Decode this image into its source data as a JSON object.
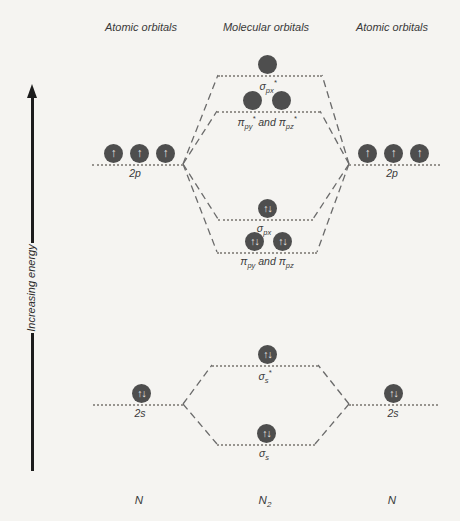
{
  "headers": {
    "left": "Atomic orbitals",
    "center": "Molecular orbitals",
    "right": "Atomic orbitals"
  },
  "energy_axis": {
    "label": "Increasing energy"
  },
  "glyphs": {
    "up": "↑",
    "paired": "↑↓"
  },
  "labels": {
    "sigma_px_star": {
      "sym": "σ",
      "sub": "px",
      "sup": "*"
    },
    "pi_p_star": {
      "sym1": "π",
      "sub1": "py",
      "sup1": "*",
      "conj": " and ",
      "sym2": "π",
      "sub2": "pz",
      "sup2": "*"
    },
    "p2_left": "2p",
    "p2_right": "2p",
    "sigma_px": {
      "sym": "σ",
      "sub": "px"
    },
    "pi_p": {
      "sym1": "π",
      "sub1": "py",
      "conj": " and ",
      "sym2": "π",
      "sub2": "pz"
    },
    "sigma_s_star": {
      "sym": "σ",
      "sub": "s",
      "sup": "*"
    },
    "s2_left": "2s",
    "s2_right": "2s",
    "sigma_s": {
      "sym": "σ",
      "sub": "s"
    }
  },
  "footer": {
    "left": "N",
    "center_base": "N",
    "center_sub": "2",
    "right": "N"
  },
  "structure": {
    "molecule": "N2",
    "molecular_levels": [
      {
        "label": "sigma_px_star",
        "circles": 1,
        "electrons": 0
      },
      {
        "label": "pi_py_star_and_pi_pz_star",
        "circles": 2,
        "electrons": 0
      },
      {
        "label": "sigma_px",
        "circles": 1,
        "electrons": 2
      },
      {
        "label": "pi_py_and_pi_pz",
        "circles": 2,
        "electrons": 4
      },
      {
        "label": "sigma_s_star",
        "circles": 1,
        "electrons": 2
      },
      {
        "label": "sigma_s",
        "circles": 1,
        "electrons": 2
      }
    ],
    "atomic_levels": [
      {
        "label": "2p",
        "side": "left",
        "electrons": 3
      },
      {
        "label": "2p",
        "side": "right",
        "electrons": 3
      },
      {
        "label": "2s",
        "side": "left",
        "electrons": 2
      },
      {
        "label": "2s",
        "side": "right",
        "electrons": 2
      }
    ]
  },
  "colors": {
    "background": "#f5f4f1",
    "orbital_circle": "#4e4e4e",
    "electron_arrow": "#e9e7e2",
    "level_line": "#97948f",
    "connector": "#6b6b6b",
    "axis": "#1c1c1c"
  }
}
